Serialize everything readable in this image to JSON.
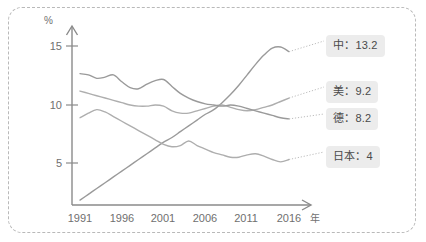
{
  "chart_data": {
    "type": "line",
    "title": "",
    "xlabel": "年",
    "ylabel": "%",
    "xlim": [
      1991,
      2016
    ],
    "ylim": [
      0,
      16
    ],
    "grid": false,
    "legend_position": "right-callout",
    "x_ticks": [
      "1991",
      "1996",
      "2001",
      "2006",
      "2011",
      "2016"
    ],
    "x_tick_values": [
      1991,
      1996,
      2001,
      2006,
      2011,
      2016
    ],
    "y_ticks": [
      "5",
      "10",
      "15"
    ],
    "y_tick_values": [
      5,
      10,
      15
    ],
    "x": [
      1991,
      1992,
      1993,
      1994,
      1995,
      1996,
      1997,
      1998,
      1999,
      2000,
      2001,
      2002,
      2003,
      2004,
      2005,
      2006,
      2007,
      2008,
      2009,
      2010,
      2011,
      2012,
      2013,
      2014,
      2015,
      2016
    ],
    "series": [
      {
        "name": "中",
        "label": "中：13.2",
        "end_value": 13.2,
        "color": "#9a9a9a",
        "values": [
          1.8,
          2.3,
          2.8,
          3.3,
          3.8,
          4.3,
          4.8,
          5.3,
          5.8,
          6.3,
          6.8,
          7.2,
          7.7,
          8.2,
          8.7,
          9.2,
          9.6,
          10.2,
          10.9,
          11.7,
          12.6,
          13.5,
          14.3,
          14.9,
          15.0,
          14.6
        ]
      },
      {
        "name": "美",
        "label": "美：9.2",
        "end_value": 9.2,
        "color": "#aeaeae",
        "values": [
          11.2,
          11.0,
          10.8,
          10.6,
          10.4,
          10.2,
          10.0,
          9.9,
          9.9,
          10.0,
          9.9,
          9.5,
          9.3,
          9.3,
          9.5,
          9.7,
          9.9,
          10.0,
          9.8,
          9.6,
          9.5,
          9.6,
          9.8,
          10.0,
          10.3,
          10.6
        ]
      },
      {
        "name": "德",
        "label": "德：8.2",
        "end_value": 8.2,
        "color": "#9a9a9a",
        "values": [
          12.7,
          12.6,
          12.3,
          12.4,
          12.6,
          12.0,
          11.5,
          11.4,
          11.8,
          12.1,
          12.2,
          11.6,
          11.0,
          10.6,
          10.3,
          10.1,
          10.0,
          9.9,
          10.0,
          9.9,
          9.7,
          9.5,
          9.3,
          9.1,
          8.9,
          8.8
        ]
      },
      {
        "name": "日本",
        "label": "日本：4",
        "end_value": 4,
        "color": "#aeaeae",
        "values": [
          8.9,
          9.3,
          9.6,
          9.4,
          9.0,
          8.6,
          8.2,
          7.8,
          7.4,
          7.0,
          6.6,
          6.4,
          6.5,
          6.9,
          6.5,
          6.2,
          5.9,
          5.7,
          5.5,
          5.5,
          5.7,
          5.8,
          5.6,
          5.3,
          5.1,
          5.3
        ]
      }
    ]
  },
  "axis": {
    "y_unit": "%",
    "x_unit": "年",
    "y_tick_0": "5",
    "y_tick_1": "10",
    "y_tick_2": "15",
    "x_tick_0": "1991",
    "x_tick_1": "1996",
    "x_tick_2": "2001",
    "x_tick_3": "2006",
    "x_tick_4": "2011",
    "x_tick_5": "2016"
  },
  "legend": {
    "china": "中：13.2",
    "usa": "美：9.2",
    "germany": "德：8.2",
    "japan": "日本：4"
  },
  "colors": {
    "line": "#9a9a9a",
    "axis": "#8a8a8a",
    "chip_bg": "#ececec",
    "border": "#b9b9b9",
    "text": "#6f6f6f"
  }
}
